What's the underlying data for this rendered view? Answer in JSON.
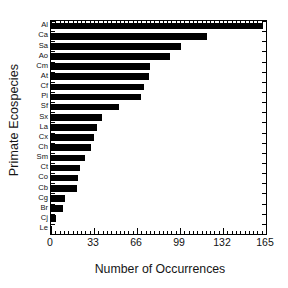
{
  "chart_data": {
    "type": "bar",
    "orientation": "horizontal",
    "title": "",
    "xlabel": "Number of Occurrences",
    "ylabel": "Primate Ecospecies",
    "categories": [
      "Al",
      "Ca",
      "Sa",
      "Ao",
      "Cm",
      "At",
      "Cf",
      "Pi",
      "Sf",
      "Sx",
      "La",
      "Cx",
      "Ch",
      "Sm",
      "Ct",
      "Co",
      "Cb",
      "Cg",
      "Br",
      "Cj",
      "Le"
    ],
    "values": [
      163,
      120,
      100,
      91,
      76,
      75,
      71,
      69,
      52,
      39,
      35,
      33,
      31,
      26,
      22,
      21,
      20,
      11,
      9,
      4,
      1
    ],
    "xlim": [
      0,
      165
    ],
    "xticks": [
      0,
      33,
      66,
      99,
      132,
      165
    ],
    "xtick_labels": [
      "0",
      "33",
      "66",
      "99",
      "132",
      "165"
    ],
    "x_minor_tick_step": 3.3,
    "grid": false,
    "legend": null,
    "bar_color": "#000000",
    "axis_color": "#000000",
    "background_color": "#ffffff"
  }
}
